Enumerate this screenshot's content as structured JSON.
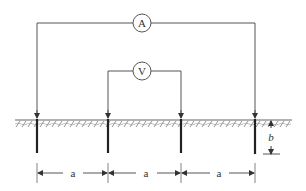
{
  "diagram": {
    "ammeter_label": "A",
    "voltmeter_label": "V",
    "spacing_labels": [
      "a",
      "a",
      "a"
    ],
    "depth_label": "b",
    "colors": {
      "line": "#555555",
      "electrode": "#222222",
      "hatch": "#666666"
    }
  }
}
